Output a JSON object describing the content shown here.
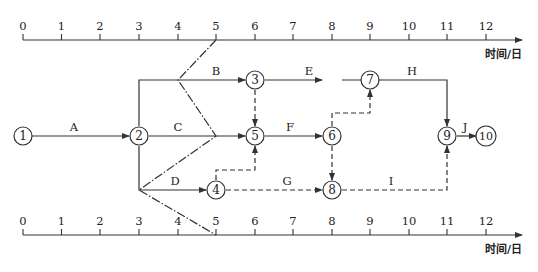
{
  "diagram": {
    "type": "time-scaled network (double-code) with front line",
    "axis": {
      "ticks": [
        "0",
        "1",
        "2",
        "3",
        "4",
        "5",
        "6",
        "7",
        "8",
        "9",
        "10",
        "11",
        "12"
      ],
      "title": "时间/日"
    },
    "nodes": [
      "1",
      "2",
      "3",
      "4",
      "5",
      "6",
      "7",
      "8",
      "9",
      "10"
    ],
    "activities": {
      "A": "A",
      "B": "B",
      "C": "C",
      "D": "D",
      "E": "E",
      "F": "F",
      "G": "G",
      "H": "H",
      "I": "I",
      "J": "J"
    },
    "edges": [
      {
        "from": "1",
        "to": "2",
        "label": "A",
        "style": "solid"
      },
      {
        "from": "2",
        "to": "3",
        "label": "B",
        "style": "solid"
      },
      {
        "from": "2",
        "to": "5",
        "label": "C",
        "style": "solid"
      },
      {
        "from": "2",
        "to": "4",
        "label": "D",
        "style": "solid"
      },
      {
        "from": "3",
        "to": "7",
        "label": "E",
        "style": "solid"
      },
      {
        "from": "5",
        "to": "6",
        "label": "F",
        "style": "solid"
      },
      {
        "from": "4",
        "to": "8",
        "label": "G",
        "style": "dashed"
      },
      {
        "from": "7",
        "to": "9",
        "label": "H",
        "style": "solid"
      },
      {
        "from": "8",
        "to": "9",
        "label": "I",
        "style": "dashed"
      },
      {
        "from": "9",
        "to": "10",
        "label": "J",
        "style": "solid"
      },
      {
        "from": "3",
        "to": "5",
        "label": "",
        "style": "dashed"
      },
      {
        "from": "4",
        "to": "5",
        "label": "",
        "style": "dashed"
      },
      {
        "from": "6",
        "to": "7",
        "label": "",
        "style": "dashed"
      },
      {
        "from": "6",
        "to": "8",
        "label": "",
        "style": "dashed"
      }
    ],
    "check_line": {
      "style": "dash-dot",
      "points_day": [
        [
          5,
          "top-axis"
        ],
        [
          4,
          "B"
        ],
        [
          5,
          "C"
        ],
        [
          3,
          "D"
        ],
        [
          5,
          "bottom-axis"
        ]
      ]
    }
  }
}
